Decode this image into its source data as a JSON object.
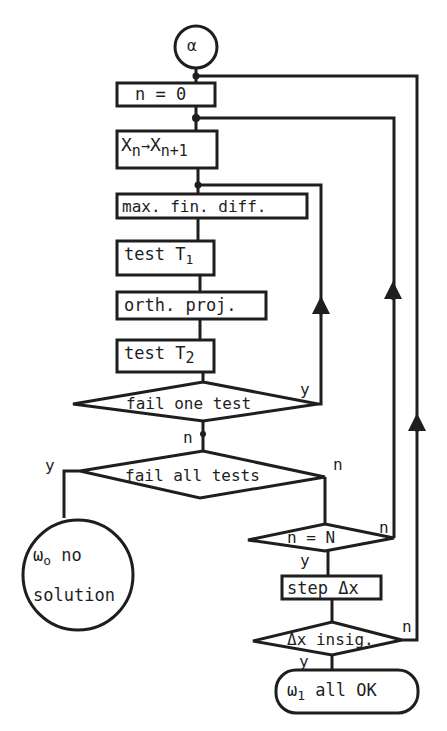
{
  "diagram": {
    "type": "flowchart",
    "start": {
      "label": "α"
    },
    "nodes": {
      "init": {
        "label": "n = 0"
      },
      "advance": {
        "main1": "X",
        "sub1": "n",
        "arrow": "→",
        "main2": "X",
        "sub2": "n+1"
      },
      "maxdiff": {
        "label": "max. fin. diff."
      },
      "test1": {
        "label": "test T",
        "sub": "1"
      },
      "orth": {
        "label": "orth. proj."
      },
      "test2": {
        "label": "test T",
        "sub": "2"
      },
      "failone": {
        "label": "fail one test"
      },
      "failall": {
        "label": "fail all tests"
      },
      "nocheck": {
        "label": "n = N"
      },
      "step": {
        "label": "step Δx"
      },
      "insig": {
        "label": "Δx insig."
      },
      "nosol": {
        "symbol": "ω",
        "sub": "o",
        "line1": "no",
        "line2": "solution"
      },
      "ok": {
        "symbol": "ω",
        "sub": "1",
        "label": "all OK"
      }
    },
    "branch_labels": {
      "failone_yes": "y",
      "failone_no": "n",
      "failall_yes": "y",
      "failall_no": "n",
      "nocheck_no": "n",
      "nocheck_yes": "y",
      "insig_no": "n",
      "insig_yes": "y"
    }
  }
}
